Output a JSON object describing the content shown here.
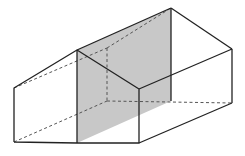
{
  "diagram": {
    "type": "3d-solid",
    "colors": {
      "background": "#ffffff",
      "edge": "#222222",
      "hidden_edge": "#555555",
      "section_fill": "#c8c8c8"
    },
    "vertices": {
      "front_bottom_left": [
        14,
        142
      ],
      "front_top_left": [
        14,
        88
      ],
      "front_peak": [
        77,
        50
      ],
      "front_bottom_mid": [
        77,
        143
      ],
      "front_top_right": [
        139,
        89
      ],
      "front_bottom_right": [
        139,
        143
      ],
      "back_peak": [
        171,
        8
      ],
      "back_top_right": [
        232,
        49
      ],
      "back_bottom_right": [
        232,
        103
      ],
      "back_bottom_mid": [
        171,
        101
      ],
      "back_top_left_hidden": [
        107,
        48
      ],
      "back_bottom_left_hidden": [
        107,
        101
      ]
    },
    "section_plane": {
      "polygon": [
        [
          77,
          50
        ],
        [
          171,
          8
        ],
        [
          171,
          101
        ],
        [
          77,
          143
        ]
      ],
      "fill": "#c8c8c8"
    }
  }
}
